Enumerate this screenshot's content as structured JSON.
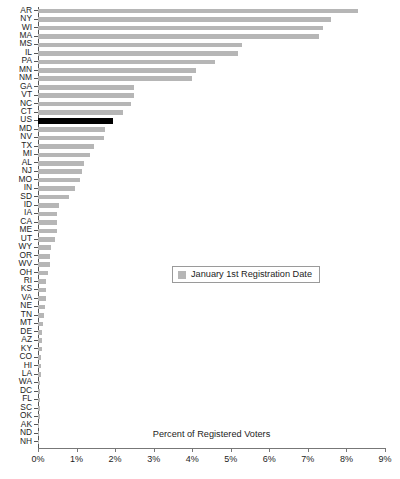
{
  "chart_data": {
    "type": "bar",
    "orientation": "horizontal",
    "title": "",
    "xlabel": "Percent of Registered Voters",
    "ylabel": "",
    "xlim": [
      0,
      9
    ],
    "xtick_labels": [
      "0%",
      "1%",
      "2%",
      "3%",
      "4%",
      "5%",
      "6%",
      "7%",
      "8%",
      "9%"
    ],
    "xtick_values": [
      0,
      1,
      2,
      3,
      4,
      5,
      6,
      7,
      8,
      9
    ],
    "grid": false,
    "legend": {
      "position": "center",
      "entries": [
        {
          "label": "January 1st Registration Date",
          "color": "#b6b6b6"
        }
      ]
    },
    "series_name": "January 1st Registration Date",
    "bar_color": "#b6b6b6",
    "highlight_color": "#000000",
    "highlight_category": "US",
    "categories": [
      "AR",
      "NY",
      "WI",
      "MA",
      "MS",
      "IL",
      "PA",
      "MN",
      "NM",
      "GA",
      "VT",
      "NC",
      "CT",
      "US",
      "MD",
      "NV",
      "TX",
      "MI",
      "AL",
      "NJ",
      "MO",
      "IN",
      "SD",
      "ID",
      "IA",
      "CA",
      "ME",
      "UT",
      "WY",
      "OR",
      "WV",
      "OH",
      "RI",
      "KS",
      "VA",
      "NE",
      "TN",
      "MT",
      "DE",
      "AZ",
      "KY",
      "CO",
      "HI",
      "LA",
      "WA",
      "DC",
      "FL",
      "SC",
      "OK",
      "AK",
      "ND",
      "NH"
    ],
    "values": [
      8.3,
      7.6,
      7.4,
      7.3,
      5.3,
      5.2,
      4.6,
      4.1,
      4.0,
      2.5,
      2.5,
      2.4,
      2.2,
      1.95,
      1.75,
      1.7,
      1.45,
      1.35,
      1.2,
      1.15,
      1.1,
      0.95,
      0.8,
      0.55,
      0.5,
      0.5,
      0.5,
      0.45,
      0.35,
      0.3,
      0.3,
      0.25,
      0.22,
      0.2,
      0.2,
      0.18,
      0.15,
      0.12,
      0.1,
      0.1,
      0.1,
      0.08,
      0.08,
      0.07,
      0.06,
      0.05,
      0.05,
      0.04,
      0.04,
      0.03,
      0.02,
      0.02
    ]
  }
}
